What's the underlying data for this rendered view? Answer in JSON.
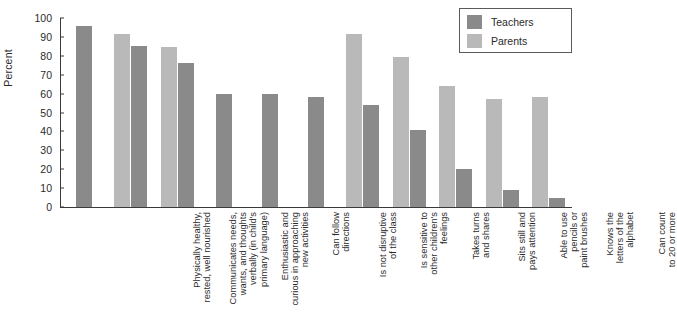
{
  "chart_data": {
    "type": "bar",
    "title": "",
    "xlabel": "",
    "ylabel": "Percent",
    "ylim": [
      0,
      100
    ],
    "yticks": [
      0,
      10,
      20,
      30,
      40,
      50,
      60,
      70,
      80,
      90,
      100
    ],
    "grid": false,
    "legend_position": "top-right",
    "categories": [
      "Physically healthy,\nrested, well nourished",
      "Communicates needs,\nwants, and thoughts\nverbally (in child's\nprimary language)",
      "Enthusiastic and\ncurious in approaching\nnew activities",
      "Can follow\ndirections",
      "Is not disruptive\nof the class",
      "Is sensitive to\nother children's\nfeelings",
      "Takes turns\nand shares",
      "Sits still and\npays attention",
      "Able to use\npencils or\npaint brushes",
      "Knows the\nletters of the\nalphabet",
      "Can count\nto 20 or more"
    ],
    "series": [
      {
        "name": "Teachers",
        "color": "#8a8a8a",
        "values": [
          96,
          85,
          76,
          60,
          60,
          58,
          54,
          41,
          20,
          9,
          5
        ]
      },
      {
        "name": "Parents",
        "color": "#b9b9b9",
        "values": [
          null,
          91.5,
          84.5,
          null,
          null,
          null,
          91.5,
          79.5,
          64,
          57,
          58
        ]
      }
    ]
  },
  "legend": {
    "items": [
      {
        "label": "Teachers",
        "color": "#8a8a8a"
      },
      {
        "label": "Parents",
        "color": "#b9b9b9"
      }
    ]
  }
}
